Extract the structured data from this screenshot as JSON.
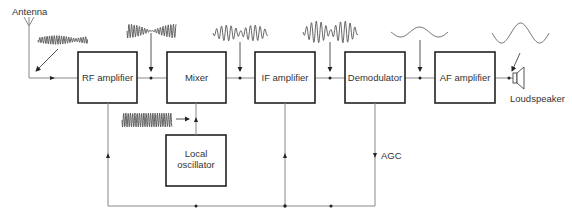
{
  "diagram": {
    "labels": {
      "antenna": "Antenna",
      "loudspeaker": "Loudspeaker",
      "agc": "AGC"
    },
    "blocks": [
      {
        "id": "rf",
        "label": "RF amplifier"
      },
      {
        "id": "mixer",
        "label": "Mixer"
      },
      {
        "id": "if",
        "label": "IF amplifier"
      },
      {
        "id": "demod",
        "label": "Demodulator"
      },
      {
        "id": "af",
        "label": "AF amplifier"
      },
      {
        "id": "lo",
        "label_line1": "Local",
        "label_line2": "oscillator"
      }
    ],
    "signal_waveforms": [
      "rf-modulated-carrier",
      "mixer-beat-waveform",
      "if-modulated-signal",
      "if-amplified-signal",
      "audio-sine",
      "amplified-audio-sine",
      "local-oscillator-carrier"
    ]
  }
}
